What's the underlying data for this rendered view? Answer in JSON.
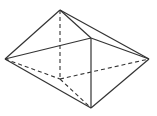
{
  "diagram": {
    "type": "polyhedron",
    "stroke_color": "#333333",
    "background": "#ffffff",
    "vertices": {
      "top": [
        60,
        10
      ],
      "front": [
        91,
        38
      ],
      "left": [
        5,
        59
      ],
      "right": [
        149,
        59
      ],
      "bottom": [
        91,
        108
      ],
      "back": [
        60,
        79
      ]
    },
    "solid_edges": [
      [
        "top",
        "left"
      ],
      [
        "top",
        "front"
      ],
      [
        "top",
        "right"
      ],
      [
        "left",
        "front"
      ],
      [
        "front",
        "right"
      ],
      [
        "front",
        "bottom"
      ],
      [
        "left",
        "bottom"
      ],
      [
        "right",
        "bottom"
      ]
    ],
    "dashed_edges": [
      [
        "top",
        "back"
      ],
      [
        "left",
        "back"
      ],
      [
        "back",
        "right"
      ],
      [
        "back",
        "bottom"
      ]
    ]
  }
}
